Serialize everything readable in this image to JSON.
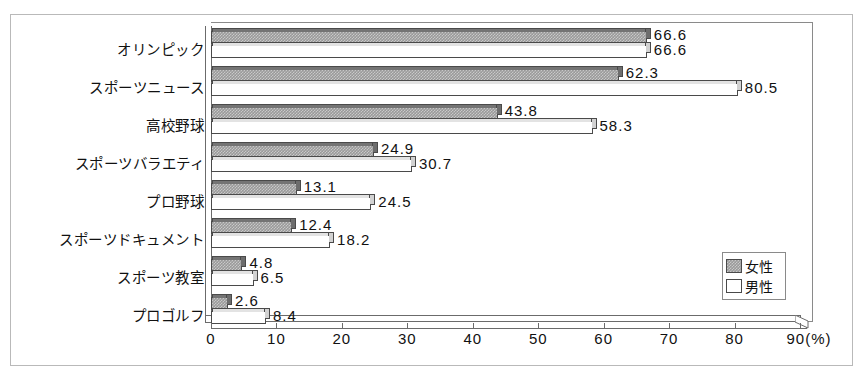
{
  "chart_data": {
    "type": "bar",
    "orientation": "horizontal",
    "title": "",
    "xlabel": "(%)",
    "ylabel": "",
    "xlim": [
      0,
      90
    ],
    "xticks": [
      0,
      10,
      20,
      30,
      40,
      50,
      60,
      70,
      80,
      90
    ],
    "xtick_labels": [
      "0",
      "10",
      "20",
      "30",
      "40",
      "50",
      "60",
      "70",
      "80",
      "90"
    ],
    "axis_unit_label": "(%)",
    "grid": false,
    "legend_position": "bottom-right",
    "categories": [
      "オリンピック",
      "スポーツニュース",
      "高校野球",
      "スポーツバラエティ",
      "プロ野球",
      "スポーツドキュメント",
      "スポーツ教室",
      "プロゴルフ"
    ],
    "series": [
      {
        "name": "女性",
        "color": "#9a9a9a",
        "values": [
          66.6,
          62.3,
          43.8,
          24.9,
          13.1,
          12.4,
          4.8,
          2.6
        ],
        "value_labels": [
          "66.6",
          "62.3",
          "43.8",
          "24.9",
          "13.1",
          "12.4",
          "4.8",
          "2.6"
        ]
      },
      {
        "name": "男性",
        "color": "#ffffff",
        "values": [
          66.6,
          80.5,
          58.3,
          30.7,
          24.5,
          18.2,
          6.5,
          8.4
        ],
        "value_labels": [
          "66.6",
          "80.5",
          "58.3",
          "30.7",
          "24.5",
          "18.2",
          "6.5",
          "8.4"
        ]
      }
    ]
  },
  "legend": {
    "items": [
      {
        "label": "女性",
        "swatch": "gray-hatch"
      },
      {
        "label": "男性",
        "swatch": "white"
      }
    ]
  }
}
